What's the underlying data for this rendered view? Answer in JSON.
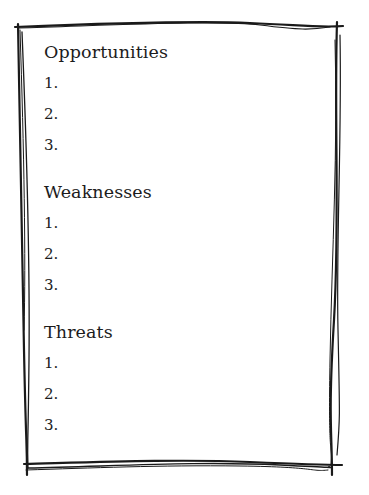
{
  "document": {
    "sections": [
      {
        "title": "Opportunities",
        "items": [
          "1.",
          "2.",
          "3."
        ]
      },
      {
        "title": "Weaknesses",
        "items": [
          "1.",
          "2.",
          "3."
        ]
      },
      {
        "title": "Threats",
        "items": [
          "1.",
          "2.",
          "3."
        ]
      }
    ]
  },
  "colors": {
    "ink": "#1c1c1c",
    "paper": "#ffffff"
  }
}
